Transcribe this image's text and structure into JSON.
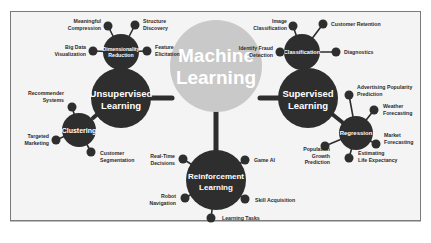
{
  "colors": {
    "node_dark": "#2e2e2e",
    "center_fill": "#c9c9c9",
    "connector": "#2e2e2e",
    "background": "#f4f4f4",
    "border": "#7a7a7a",
    "leaf_text": "#2b2b2b",
    "node_text": "#ffffff"
  },
  "center": {
    "line1": "Machine",
    "line2": "Learning"
  },
  "unsupervised": {
    "line1": "Unsupervised",
    "line2": "Learning",
    "dimensionality": {
      "line1": "Dimensionality",
      "line2": "Reduction",
      "leaves": [
        {
          "line1": "Meaningful",
          "line2": "Compression"
        },
        {
          "line1": "Structure",
          "line2": "Discovery"
        },
        {
          "line1": "Big Data",
          "line2": "Visualization"
        },
        {
          "line1": "Feature",
          "line2": "Elicitation"
        }
      ]
    },
    "clustering": {
      "label": "Clustering",
      "leaves": [
        {
          "line1": "Recommender",
          "line2": "Systems"
        },
        {
          "line1": "Targeted",
          "line2": "Marketing"
        },
        {
          "line1": "Customer",
          "line2": "Segmentation"
        }
      ]
    }
  },
  "supervised": {
    "line1": "Supervised",
    "line2": "Learning",
    "classification": {
      "label": "Classification",
      "leaves": [
        {
          "line1": "Image",
          "line2": "Classification"
        },
        {
          "line1": "Customer Retention",
          "line2": ""
        },
        {
          "line1": "Identify Fraud",
          "line2": "Detection"
        },
        {
          "line1": "Diagnostics",
          "line2": ""
        }
      ]
    },
    "regression": {
      "label": "Regression",
      "leaves": [
        {
          "line1": "Advertising Popularity",
          "line2": "Prediction"
        },
        {
          "line1": "Weather",
          "line2": "Forecasting"
        },
        {
          "line1": "Market",
          "line2": "Forecasting"
        },
        {
          "line1": "Estimating",
          "line2": "Life Expectancy"
        },
        {
          "line1": "Population",
          "line2": "Growth",
          "line3": "Prediction"
        }
      ]
    }
  },
  "reinforcement": {
    "line1": "Reinforcement",
    "line2": "Learning",
    "leaves": [
      {
        "line1": "Real-Time",
        "line2": "Decisions"
      },
      {
        "line1": "Game AI",
        "line2": ""
      },
      {
        "line1": "Robot",
        "line2": "Navigation"
      },
      {
        "line1": "Skill Acquisition",
        "line2": ""
      },
      {
        "line1": "Learning Tasks",
        "line2": ""
      }
    ]
  }
}
